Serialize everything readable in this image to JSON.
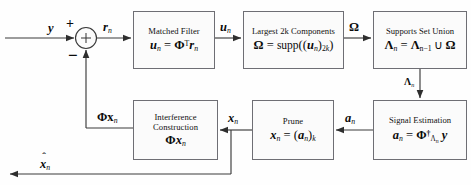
{
  "diagram": {
    "type": "signal-processing-block-diagram",
    "colors": {
      "line": "#3a3a3a",
      "box_border": "#6e6e74",
      "box_fill": "#fbfbfb",
      "text": "#0b0b0b",
      "background": "#ffffff"
    }
  },
  "blocks": [
    {
      "id": "matched-filter",
      "title": "Matched Filter",
      "equation_lhs": "u",
      "equation_lhs_sub": "n",
      "equation": "u_n = Φ^T r_n",
      "x": 133,
      "y": 11,
      "w": 82,
      "h": 58
    },
    {
      "id": "largest-components",
      "title": "Largest 2k Components",
      "equation": "Ω = supp((u_n)_2k)",
      "x": 243,
      "y": 11,
      "w": 101,
      "h": 58
    },
    {
      "id": "supports-set-union",
      "title": "Supports Set Union",
      "equation": "Λ_n = Λ_{n-1} ∪ Ω",
      "x": 373,
      "y": 11,
      "w": 94,
      "h": 58
    },
    {
      "id": "signal-estimation",
      "title": "Signal Estimation",
      "equation": "a_n = Φ†_{Λ_n} y",
      "x": 373,
      "y": 100,
      "w": 94,
      "h": 60
    },
    {
      "id": "prune",
      "title": "Prune",
      "equation": "x_n = (a_n)_k",
      "x": 252,
      "y": 100,
      "w": 82,
      "h": 60
    },
    {
      "id": "interference-construction",
      "title": "Interference Construction",
      "equation": "Φx_n",
      "x": 133,
      "y": 100,
      "w": 85,
      "h": 60
    }
  ],
  "signals": {
    "input": "y",
    "residual": "r",
    "residual_sub": "n",
    "matched_out": "u",
    "matched_out_sub": "n",
    "omega": "Ω",
    "lambda": "Λ",
    "lambda_sub": "n",
    "estimate": "a",
    "estimate_sub": "n",
    "pruned": "x",
    "pruned_sub": "n",
    "interference": "Φx",
    "interference_sub": "n",
    "output": "x",
    "output_sub": "n",
    "output_hat": "ˆ"
  },
  "summing_junction": {
    "name": "adder",
    "symbol": "+",
    "plus_sign": "+",
    "minus_sign": "−",
    "cx": 86,
    "cy": 38,
    "r": 10.5
  },
  "equations_text": {
    "matched_filter": "uₙ = Φᵀ rₙ",
    "largest_components": "Ω = supp((uₙ)₂ₖ)",
    "supports_union": "Λₙ = Λₙ₋₁ ∪ Ω",
    "signal_estimation": "aₙ = Φ†_{Λₙ} y",
    "prune": "xₙ = (aₙ)ₖ",
    "interference": "Φxₙ"
  }
}
